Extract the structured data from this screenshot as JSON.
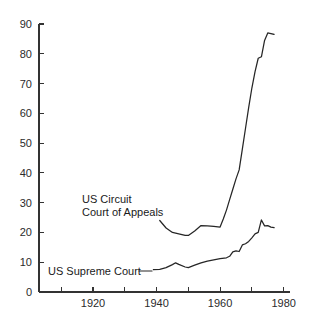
{
  "chart_data": {
    "type": "line",
    "title": "",
    "subtitle": "",
    "xlabel": "",
    "ylabel": "",
    "xlim": [
      1903,
      1982
    ],
    "ylim": [
      0,
      90
    ],
    "grid": false,
    "legend_position": "inline-annotation",
    "x_ticks": [
      1910,
      1920,
      1930,
      1940,
      1950,
      1960,
      1970,
      1980
    ],
    "x_tick_labels": [
      "",
      "1920",
      "",
      "1940",
      "",
      "1960",
      "",
      "1980"
    ],
    "y_ticks": [
      0,
      10,
      20,
      30,
      40,
      50,
      60,
      70,
      80,
      90
    ],
    "y_tick_labels": [
      "0",
      "10",
      "20",
      "30",
      "40",
      "50",
      "60",
      "70",
      "80",
      "90"
    ],
    "series": [
      {
        "name": "US Circuit Court of Appeals",
        "annotation": "US Circuit\nCourt of Appeals",
        "annotation_line1": "US Circuit",
        "annotation_line2": "Court of Appeals",
        "x": [
          1941,
          1943,
          1945,
          1947,
          1949,
          1950,
          1952,
          1954,
          1956,
          1958,
          1960,
          1961,
          1962,
          1963,
          1964,
          1965,
          1966,
          1967,
          1968,
          1969,
          1970,
          1971,
          1972,
          1973,
          1974,
          1975,
          1976,
          1977
        ],
        "values": [
          24.0,
          21.5,
          20.0,
          19.5,
          19.0,
          19.0,
          20.5,
          22.3,
          22.2,
          22.0,
          21.8,
          24.5,
          27.5,
          31.0,
          34.5,
          38.0,
          41.0,
          48.0,
          55.0,
          62.0,
          68.5,
          74.0,
          78.5,
          79.0,
          84.5,
          87.0,
          86.8,
          86.5
        ]
      },
      {
        "name": "US Supreme Court",
        "annotation": "US Supreme Court",
        "annotation_line1": "US Supreme Court",
        "x": [
          1939,
          1941,
          1943,
          1945,
          1946,
          1947,
          1949,
          1950,
          1952,
          1954,
          1956,
          1958,
          1960,
          1962,
          1963,
          1964,
          1965,
          1966,
          1967,
          1968,
          1969,
          1970,
          1971,
          1972,
          1973,
          1974,
          1975,
          1976,
          1977
        ],
        "values": [
          7.5,
          7.6,
          8.2,
          9.2,
          9.8,
          9.3,
          8.4,
          8.2,
          9.0,
          9.8,
          10.4,
          10.8,
          11.2,
          11.5,
          12.0,
          13.5,
          13.8,
          13.6,
          15.8,
          16.2,
          17.0,
          18.2,
          19.5,
          20.0,
          24.2,
          22.2,
          22.3,
          21.8,
          21.6
        ]
      }
    ],
    "colors": {
      "line": "#262626",
      "axis": "#333333",
      "text": "#1a1a1a",
      "background": "#ffffff"
    }
  },
  "annotations": {
    "circuit_label_line1": "US Circuit",
    "circuit_label_line2": "Court of Appeals",
    "supreme_label": "US Supreme Court"
  }
}
